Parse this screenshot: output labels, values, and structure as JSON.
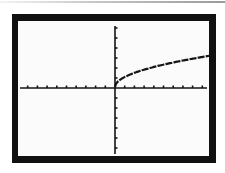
{
  "screen": {
    "frame_color": "#111111",
    "background_color": "#fbfbfb",
    "ink_color": "#151515"
  },
  "chart_data": {
    "type": "line",
    "title": "",
    "xlabel": "",
    "ylabel": "",
    "function": "y = sqrt(x)",
    "xlim": [
      -10,
      10
    ],
    "ylim": [
      -6.5,
      6.5
    ],
    "xscale_tick": 1,
    "yscale_tick": 1,
    "grid": false,
    "legend": null,
    "x_ticks_left": 9,
    "x_ticks_right": 9,
    "y_ticks_above": 6,
    "y_ticks_below": 6,
    "series": [
      {
        "name": "Y1",
        "x": [
          0,
          0.25,
          0.5,
          1,
          2,
          3,
          4,
          5,
          6,
          7,
          8,
          9,
          9.6
        ],
        "values": [
          0,
          0.5,
          0.71,
          1,
          1.41,
          1.73,
          2,
          2.24,
          2.45,
          2.65,
          2.83,
          3,
          3.1
        ]
      }
    ]
  }
}
